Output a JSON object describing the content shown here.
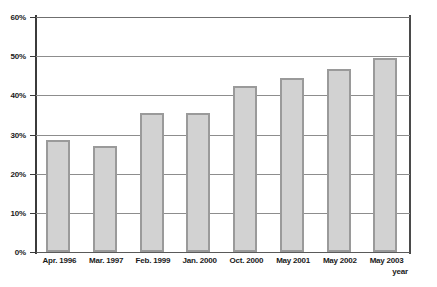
{
  "chart_data": {
    "type": "bar",
    "title": "",
    "xlabel": "year",
    "ylabel": "",
    "categories": [
      "Apr. 1996",
      "Mar. 1997",
      "Feb. 1999",
      "Jan. 2000",
      "Oct. 2000",
      "May 2001",
      "May 2002",
      "May 2003"
    ],
    "values": [
      28.5,
      27.0,
      35.5,
      35.5,
      42.5,
      44.5,
      46.7,
      49.5
    ],
    "ylim": [
      0,
      60
    ],
    "ytick_labels": [
      "0%",
      "10%",
      "20%",
      "30%",
      "40%",
      "50%",
      "60%"
    ],
    "ytick_values": [
      0,
      10,
      20,
      30,
      40,
      50,
      60
    ],
    "grid": true,
    "legend": false,
    "legend_position": "none",
    "bar_fill_color": "#d2d2d2",
    "bar_border_color": "#9a9a9a",
    "gridline_color": "#8d8d8d",
    "axis_color": "#3b3b3b"
  }
}
